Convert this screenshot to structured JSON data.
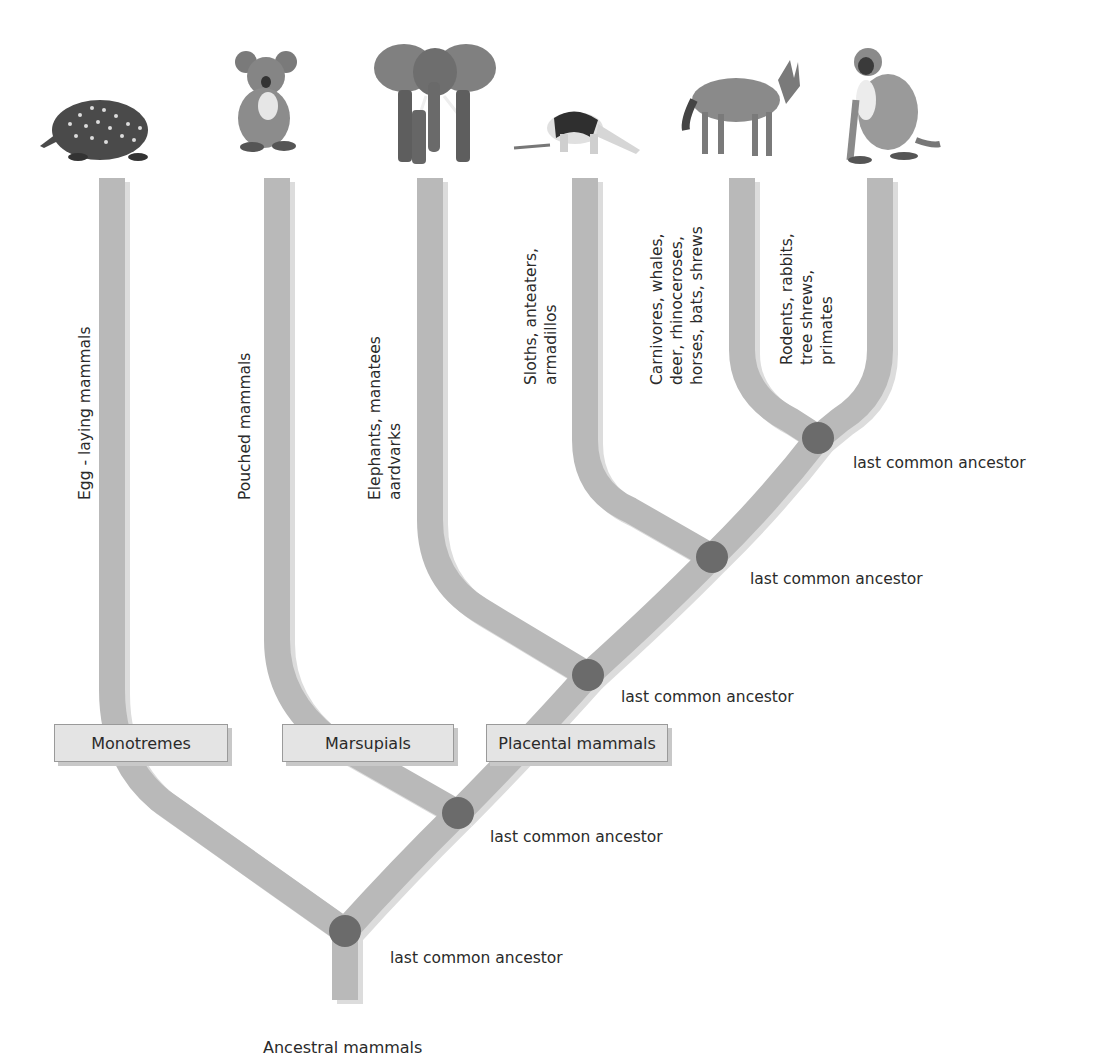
{
  "diagram": {
    "type": "phylogenetic-tree",
    "root_label": "Ancestral mammals",
    "lineages": [
      {
        "id": "egg",
        "label_lines": [
          "Egg - laying mammals"
        ],
        "animal_icon": "echidna-icon"
      },
      {
        "id": "pouched",
        "label_lines": [
          "Pouched mammals"
        ],
        "animal_icon": "koala-icon"
      },
      {
        "id": "elephants",
        "label_lines": [
          "Elephants, manatees",
          "aardvarks"
        ],
        "animal_icon": "elephant-icon"
      },
      {
        "id": "sloths",
        "label_lines": [
          "Sloths, anteaters,",
          "armadillos"
        ],
        "animal_icon": "anteater-icon"
      },
      {
        "id": "carnivores",
        "label_lines": [
          "Carnivores, whales,",
          "deer, rhinoceroses,",
          "horses, bats, shrews"
        ],
        "animal_icon": "wolf-icon"
      },
      {
        "id": "rodents",
        "label_lines": [
          "Rodents, rabbits,",
          "tree shrews,",
          "primates"
        ],
        "animal_icon": "monkey-icon"
      }
    ],
    "groups": [
      {
        "label": "Monotremes"
      },
      {
        "label": "Marsupials"
      },
      {
        "label": "Placental mammals"
      }
    ],
    "nodes": [
      {
        "label": "last common ancestor"
      },
      {
        "label": "last common ancestor"
      },
      {
        "label": "last common ancestor"
      },
      {
        "label": "last common ancestor"
      },
      {
        "label": "last common ancestor"
      }
    ]
  },
  "colors": {
    "branch": "#b9b9b9",
    "branch_shadow": "#dcdcdc",
    "node": "#6b6b6b",
    "group_box_bg": "#e4e4e4",
    "text": "#2a2a2a"
  }
}
